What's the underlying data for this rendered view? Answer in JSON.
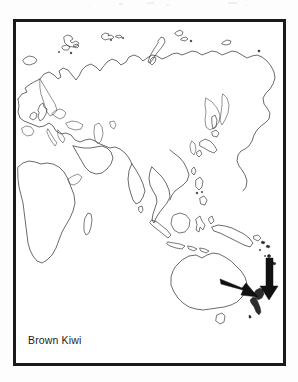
{
  "figure": {
    "type": "distribution-map",
    "caption": "Brown Kiwi",
    "frame_color": "#1a1a1a",
    "background_color": "#ffffff",
    "coastline_color": "#3a3a3a",
    "arrow_color": "#111111"
  },
  "map": {
    "projection_region": "Eastern Hemisphere",
    "landmasses": [
      "Europe",
      "Africa",
      "Asia",
      "Arabian Peninsula",
      "India",
      "Southeast Asia",
      "Indonesia",
      "Philippines",
      "Japan",
      "New Guinea",
      "Australia",
      "Tasmania",
      "Madagascar",
      "New Zealand",
      "Sri Lanka",
      "Svalbard",
      "Novaya Zemlya",
      "Severnaya Zemlya",
      "Iceland",
      "Great Britain",
      "Ireland",
      "Sumatra",
      "Borneo",
      "Java",
      "Sulawesi"
    ]
  },
  "annotations": {
    "arrows": [
      {
        "name": "arrow-to-north-island",
        "direction": "down-right",
        "target": "New Zealand North Island"
      },
      {
        "name": "arrow-to-south-island",
        "direction": "down",
        "target": "New Zealand South Island"
      }
    ],
    "highlighted_range": "New Zealand"
  },
  "caption": {
    "species_common_name": "Brown Kiwi"
  }
}
